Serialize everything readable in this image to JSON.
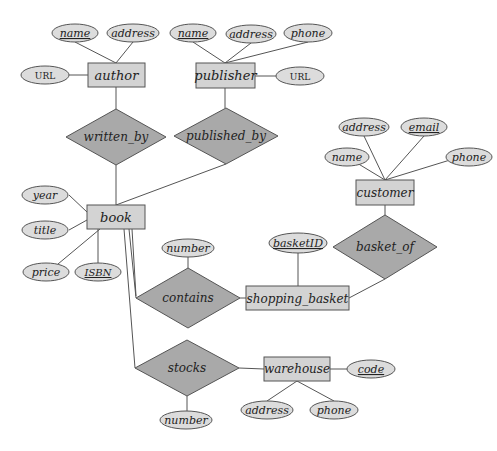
{
  "diagram": {
    "type": "ER diagram",
    "colors": {
      "entity_fill": "#d3d3d3",
      "relationship_fill": "#a9a9a9",
      "attribute_fill": "#dcdcdc",
      "stroke": "#555555"
    },
    "entities": {
      "author": {
        "label": "author",
        "attributes": {
          "name": "name",
          "address": "address",
          "url": "URL"
        },
        "key": "name"
      },
      "publisher": {
        "label": "publisher",
        "attributes": {
          "name": "name",
          "address": "address",
          "phone": "phone",
          "url": "URL"
        },
        "key": "name"
      },
      "book": {
        "label": "book",
        "attributes": {
          "year": "year",
          "title": "title",
          "price": "price",
          "isbn": "ISBN"
        },
        "key": "ISBN"
      },
      "customer": {
        "label": "customer",
        "attributes": {
          "name": "name",
          "address": "address",
          "email": "email",
          "phone": "phone"
        },
        "key": "email"
      },
      "shopping_basket": {
        "label": "shopping_basket",
        "attributes": {
          "basket_id": "basketID"
        },
        "key": "basketID"
      },
      "warehouse": {
        "label": "warehouse",
        "attributes": {
          "code": "code",
          "address": "address",
          "phone": "phone"
        },
        "key": "code"
      }
    },
    "relationships": {
      "written_by": {
        "label": "written_by",
        "connects": [
          "author",
          "book"
        ]
      },
      "published_by": {
        "label": "published_by",
        "connects": [
          "publisher",
          "book"
        ]
      },
      "basket_of": {
        "label": "basket_of",
        "connects": [
          "customer",
          "shopping_basket"
        ]
      },
      "contains": {
        "label": "contains",
        "connects": [
          "book",
          "shopping_basket"
        ],
        "attributes": {
          "number": "number"
        }
      },
      "stocks": {
        "label": "stocks",
        "connects": [
          "book",
          "warehouse"
        ],
        "attributes": {
          "number": "number"
        }
      }
    }
  }
}
